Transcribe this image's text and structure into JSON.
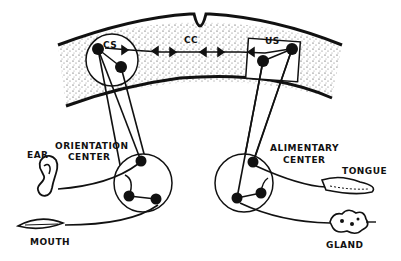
{
  "diagram": {
    "type": "neural conditioning diagram",
    "colors": {
      "ink": "#111111",
      "paper": "#ffffff",
      "cortex_stipple": "#9a9a9a"
    },
    "cortex": {
      "labels": {
        "cs": "CS",
        "cc": "CC",
        "us": "US"
      }
    },
    "centers": {
      "orientation": {
        "line1": "ORIENTATION",
        "line2": "CENTER"
      },
      "alimentary": {
        "line1": "ALIMENTARY",
        "line2": "CENTER"
      }
    },
    "organs": {
      "ear": "EAR",
      "mouth": "MOUTH",
      "tongue": "TONGUE",
      "gland": "GLAND"
    }
  }
}
